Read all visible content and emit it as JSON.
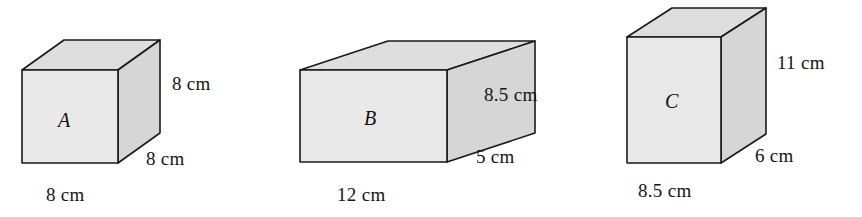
{
  "figure": {
    "unit": "cm",
    "stroke_color": "#1a1a1a",
    "front_face_color": "#e9e9e9",
    "top_face_color": "#dedede",
    "side_face_color": "#d6d6d6",
    "background_color": "#ffffff"
  },
  "boxes": [
    {
      "id": "box-a",
      "letter": "A",
      "width_label": "8 cm",
      "height_label": "8 cm",
      "depth_label": "8 cm",
      "geometry": {
        "fx0": 22,
        "fy0": 70,
        "fx1": 118,
        "fy1": 163,
        "dx": 42,
        "dy": -30
      },
      "letter_pos": {
        "x": 58,
        "y": 110
      },
      "height_label_pos": {
        "x": 172,
        "y": 74
      },
      "depth_label_pos": {
        "x": 146,
        "y": 149
      },
      "width_label_pos": {
        "x": 46,
        "y": 185
      }
    },
    {
      "id": "box-b",
      "letter": "B",
      "width_label": "12 cm",
      "height_label": "8.5 cm",
      "depth_label": "5 cm",
      "geometry": {
        "fx0": 300,
        "fy0": 70,
        "fx1": 447,
        "fy1": 162,
        "dx": 88,
        "dy": -29
      },
      "letter_pos": {
        "x": 364,
        "y": 108
      },
      "height_label_pos": {
        "x": 484,
        "y": 85
      },
      "depth_label_pos": {
        "x": 476,
        "y": 147
      },
      "width_label_pos": {
        "x": 337,
        "y": 185
      }
    },
    {
      "id": "box-c",
      "letter": "C",
      "width_label": "8.5 cm",
      "height_label": "11 cm",
      "depth_label": "6 cm",
      "geometry": {
        "fx0": 627,
        "fy0": 37,
        "fx1": 721,
        "fy1": 163,
        "dx": 45,
        "dy": -29
      },
      "letter_pos": {
        "x": 665,
        "y": 91
      },
      "height_label_pos": {
        "x": 777,
        "y": 53
      },
      "depth_label_pos": {
        "x": 755,
        "y": 146
      },
      "width_label_pos": {
        "x": 638,
        "y": 181
      }
    }
  ]
}
